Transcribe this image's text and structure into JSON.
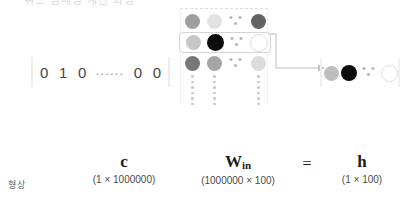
{
  "figure": {
    "top_clipped_text": "워드 임베딩 계산 과정",
    "shape_row_label": "형상"
  },
  "input_vector": {
    "name": "c",
    "cells": [
      "0",
      "1",
      "0"
    ],
    "ellipsis": "......",
    "tail_cells": [
      "0",
      "0"
    ]
  },
  "matrix": {
    "name": "W",
    "subscript": "in",
    "ellipsis": "• • •",
    "rows": [
      {
        "highlighted": false,
        "nodes": [
          {
            "color": "#9e9e9e",
            "size": 15,
            "outline": false
          },
          {
            "color": "#e2e2e2",
            "size": 15,
            "outline": false
          },
          {
            "color": "#636363",
            "size": 15,
            "outline": false
          }
        ]
      },
      {
        "highlighted": true,
        "nodes": [
          {
            "color": "#c6c6c6",
            "size": 15,
            "outline": false
          },
          {
            "color": "#0d0d0d",
            "size": 17,
            "outline": false
          },
          {
            "color": "#ffffff",
            "size": 16,
            "outline": true
          }
        ]
      },
      {
        "highlighted": false,
        "nodes": [
          {
            "color": "#777777",
            "size": 15,
            "outline": false
          },
          {
            "color": "#a5a5a5",
            "size": 15,
            "outline": false
          },
          {
            "color": "#dcdcdc",
            "size": 15,
            "outline": false
          }
        ]
      }
    ],
    "vertical_dots_count": 6
  },
  "output_vector": {
    "name": "h",
    "ellipsis": "• • •",
    "nodes": [
      {
        "color": "#bebebe",
        "size": 15,
        "outline": false
      },
      {
        "color": "#0d0d0d",
        "size": 16,
        "outline": false
      },
      {
        "color": "#ffffff",
        "size": 15,
        "outline": true
      }
    ]
  },
  "labels": {
    "c": {
      "symbol": "c",
      "dim": "(1 × 1000000)"
    },
    "w_in": {
      "symbol": "W",
      "subscript": "in",
      "dim": "(1000000 × 100)"
    },
    "equals": "=",
    "h": {
      "symbol": "h",
      "dim": "(1 × 100)"
    }
  },
  "colors": {
    "arrow": "#d2d2d2",
    "highlight_border": "#d5d5d5",
    "bracket": "#ededed",
    "dot": "#c9c9c9"
  }
}
